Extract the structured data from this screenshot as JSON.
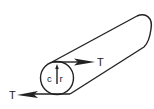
{
  "diagram": {
    "stroke_color": "#222222",
    "background": "#ffffff",
    "labels": {
      "torque_top": "T",
      "torque_bottom": "T",
      "center": "c",
      "radius": "r"
    }
  }
}
